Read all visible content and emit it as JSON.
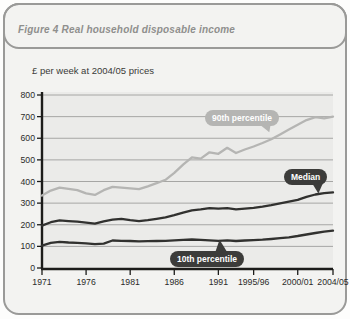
{
  "figure": {
    "title": "Figure 4 Real household disposable income",
    "unit_label": "£ per week at 2004/05 prices"
  },
  "colors": {
    "card_bg": "#f3f3f1",
    "card_border": "#9a9a98",
    "plot_bg": "#ebebe9",
    "gridline": "#a6a6a4",
    "axis": "#1c1c1a",
    "tick_text": "#2b2b29",
    "title_gray": "#8f8f8d",
    "series_light": "#b5b5b3",
    "series_dark": "#31312f",
    "bubble_light_bg": "#b5b5b3",
    "bubble_dark_bg": "#3c3c3a",
    "bubble_text": "#ffffff"
  },
  "chart_data": {
    "type": "line",
    "title": "Figure 4 Real household disposable income",
    "ylabel": "£ per week at 2004/05 prices",
    "ylim": [
      0,
      800
    ],
    "ytick_step": 100,
    "grid": true,
    "x": [
      "1971",
      "1972",
      "1973",
      "1974",
      "1975",
      "1976",
      "1977",
      "1978",
      "1979",
      "1980",
      "1981",
      "1982",
      "1983",
      "1984",
      "1985",
      "1986",
      "1987",
      "1988",
      "1989",
      "1990",
      "1991",
      "1992",
      "1993",
      "1994/95",
      "1995/96",
      "1996/97",
      "1997/98",
      "1998/99",
      "1999/00",
      "2000/01",
      "2001/02",
      "2002/03",
      "2003/04",
      "2004/05"
    ],
    "xtick_labels": [
      "1971",
      "1976",
      "1981",
      "1986",
      "1991",
      "1995/96",
      "2000/01",
      "2004/05"
    ],
    "xtick_indices": [
      0,
      5,
      10,
      15,
      20,
      24,
      29,
      33
    ],
    "series": [
      {
        "name": "90th percentile",
        "color": "#b5b5b3",
        "values": [
          335,
          358,
          372,
          366,
          360,
          345,
          338,
          360,
          375,
          372,
          368,
          365,
          378,
          392,
          408,
          440,
          478,
          512,
          506,
          535,
          528,
          556,
          532,
          548,
          562,
          578,
          595,
          618,
          640,
          662,
          684,
          698,
          692,
          700
        ]
      },
      {
        "name": "Median",
        "color": "#31312f",
        "values": [
          196,
          212,
          220,
          217,
          214,
          210,
          205,
          216,
          224,
          227,
          221,
          217,
          221,
          227,
          234,
          244,
          256,
          267,
          271,
          277,
          274,
          277,
          271,
          274,
          278,
          284,
          291,
          299,
          307,
          315,
          329,
          340,
          346,
          350
        ]
      },
      {
        "name": "10th percentile",
        "color": "#31312f",
        "values": [
          103,
          116,
          121,
          118,
          116,
          114,
          110,
          113,
          127,
          126,
          125,
          123,
          124,
          125,
          126,
          128,
          130,
          132,
          130,
          128,
          126,
          128,
          125,
          127,
          129,
          131,
          134,
          138,
          142,
          148,
          155,
          162,
          168,
          173
        ]
      }
    ],
    "annotations": [
      {
        "text": "90th percentile",
        "style": "light"
      },
      {
        "text": "Median",
        "style": "dark"
      },
      {
        "text": "10th percentile",
        "style": "dark"
      }
    ]
  }
}
